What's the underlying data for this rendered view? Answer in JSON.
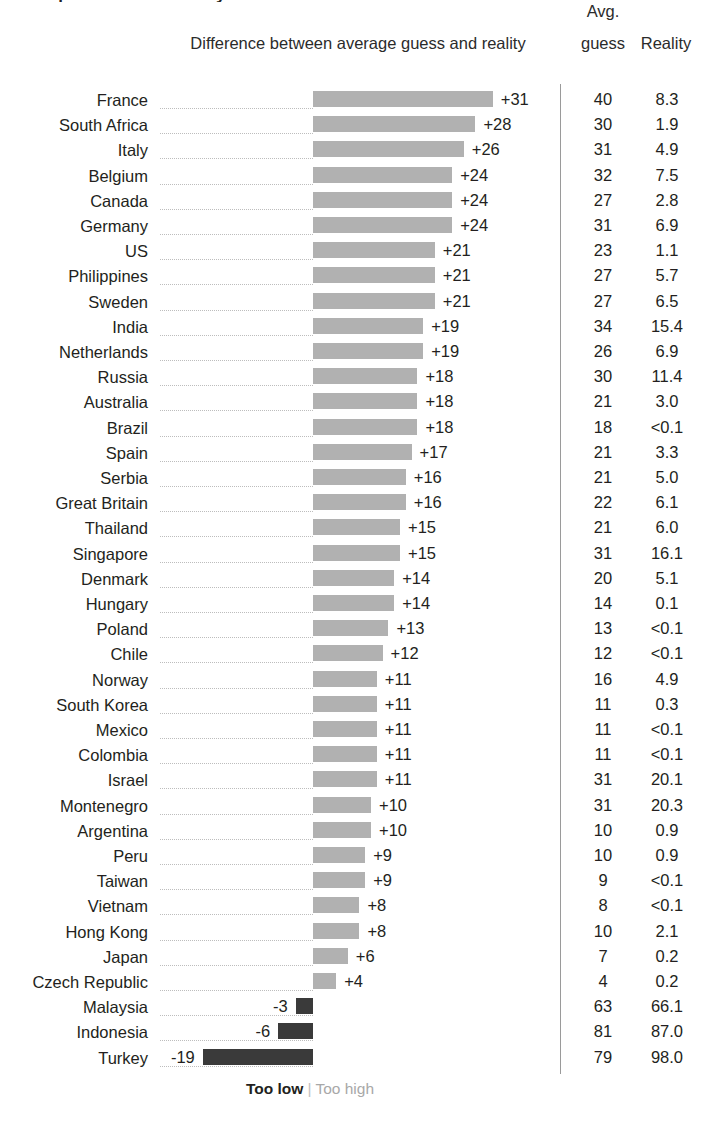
{
  "title_sliver": "Perceptions are not reality",
  "headers": {
    "difference": "Difference between average guess and reality",
    "avg_line1": "Avg.",
    "avg_line2": "guess",
    "reality": "Reality"
  },
  "legend": {
    "too_low": "Too low",
    "separator": "|",
    "too_high": "Too high"
  },
  "chart_data": {
    "type": "bar",
    "title": "Perceptions are not reality",
    "xlabel": "Difference between average guess and reality",
    "ylabel": "",
    "orientation": "horizontal",
    "baseline": 0,
    "grid": false,
    "legend_position": "bottom",
    "legend": [
      {
        "label": "Too low",
        "color": "#3a3a3a"
      },
      {
        "label": "Too high",
        "color": "#b1b1b1"
      }
    ],
    "columns": [
      "Country",
      "Difference",
      "Avg. guess",
      "Reality"
    ],
    "categories": [
      "France",
      "South Africa",
      "Italy",
      "Belgium",
      "Canada",
      "Germany",
      "US",
      "Philippines",
      "Sweden",
      "India",
      "Netherlands",
      "Russia",
      "Australia",
      "Brazil",
      "Spain",
      "Serbia",
      "Great Britain",
      "Thailand",
      "Singapore",
      "Denmark",
      "Hungary",
      "Poland",
      "Chile",
      "Norway",
      "South Korea",
      "Mexico",
      "Colombia",
      "Israel",
      "Montenegro",
      "Argentina",
      "Peru",
      "Taiwan",
      "Vietnam",
      "Hong Kong",
      "Japan",
      "Czech Republic",
      "Malaysia",
      "Indonesia",
      "Turkey"
    ],
    "values": [
      31,
      28,
      26,
      24,
      24,
      24,
      21,
      21,
      21,
      19,
      19,
      18,
      18,
      18,
      17,
      16,
      16,
      15,
      15,
      14,
      14,
      13,
      12,
      11,
      11,
      11,
      11,
      11,
      10,
      10,
      9,
      9,
      8,
      8,
      6,
      4,
      -3,
      -6,
      -19
    ],
    "rows": [
      {
        "country": "France",
        "difference": 31,
        "difference_label": "+31",
        "avg_guess": "40",
        "reality": "8.3"
      },
      {
        "country": "South Africa",
        "difference": 28,
        "difference_label": "+28",
        "avg_guess": "30",
        "reality": "1.9"
      },
      {
        "country": "Italy",
        "difference": 26,
        "difference_label": "+26",
        "avg_guess": "31",
        "reality": "4.9"
      },
      {
        "country": "Belgium",
        "difference": 24,
        "difference_label": "+24",
        "avg_guess": "32",
        "reality": "7.5"
      },
      {
        "country": "Canada",
        "difference": 24,
        "difference_label": "+24",
        "avg_guess": "27",
        "reality": "2.8"
      },
      {
        "country": "Germany",
        "difference": 24,
        "difference_label": "+24",
        "avg_guess": "31",
        "reality": "6.9"
      },
      {
        "country": "US",
        "difference": 21,
        "difference_label": "+21",
        "avg_guess": "23",
        "reality": "1.1"
      },
      {
        "country": "Philippines",
        "difference": 21,
        "difference_label": "+21",
        "avg_guess": "27",
        "reality": "5.7"
      },
      {
        "country": "Sweden",
        "difference": 21,
        "difference_label": "+21",
        "avg_guess": "27",
        "reality": "6.5"
      },
      {
        "country": "India",
        "difference": 19,
        "difference_label": "+19",
        "avg_guess": "34",
        "reality": "15.4"
      },
      {
        "country": "Netherlands",
        "difference": 19,
        "difference_label": "+19",
        "avg_guess": "26",
        "reality": "6.9"
      },
      {
        "country": "Russia",
        "difference": 18,
        "difference_label": "+18",
        "avg_guess": "30",
        "reality": "11.4"
      },
      {
        "country": "Australia",
        "difference": 18,
        "difference_label": "+18",
        "avg_guess": "21",
        "reality": "3.0"
      },
      {
        "country": "Brazil",
        "difference": 18,
        "difference_label": "+18",
        "avg_guess": "18",
        "reality": "<0.1"
      },
      {
        "country": "Spain",
        "difference": 17,
        "difference_label": "+17",
        "avg_guess": "21",
        "reality": "3.3"
      },
      {
        "country": "Serbia",
        "difference": 16,
        "difference_label": "+16",
        "avg_guess": "21",
        "reality": "5.0"
      },
      {
        "country": "Great Britain",
        "difference": 16,
        "difference_label": "+16",
        "avg_guess": "22",
        "reality": "6.1"
      },
      {
        "country": "Thailand",
        "difference": 15,
        "difference_label": "+15",
        "avg_guess": "21",
        "reality": "6.0"
      },
      {
        "country": "Singapore",
        "difference": 15,
        "difference_label": "+15",
        "avg_guess": "31",
        "reality": "16.1"
      },
      {
        "country": "Denmark",
        "difference": 14,
        "difference_label": "+14",
        "avg_guess": "20",
        "reality": "5.1"
      },
      {
        "country": "Hungary",
        "difference": 14,
        "difference_label": "+14",
        "avg_guess": "14",
        "reality": "0.1"
      },
      {
        "country": "Poland",
        "difference": 13,
        "difference_label": "+13",
        "avg_guess": "13",
        "reality": "<0.1"
      },
      {
        "country": "Chile",
        "difference": 12,
        "difference_label": "+12",
        "avg_guess": "12",
        "reality": "<0.1"
      },
      {
        "country": "Norway",
        "difference": 11,
        "difference_label": "+11",
        "avg_guess": "16",
        "reality": "4.9"
      },
      {
        "country": "South Korea",
        "difference": 11,
        "difference_label": "+11",
        "avg_guess": "11",
        "reality": "0.3"
      },
      {
        "country": "Mexico",
        "difference": 11,
        "difference_label": "+11",
        "avg_guess": "11",
        "reality": "<0.1"
      },
      {
        "country": "Colombia",
        "difference": 11,
        "difference_label": "+11",
        "avg_guess": "11",
        "reality": "<0.1"
      },
      {
        "country": "Israel",
        "difference": 11,
        "difference_label": "+11",
        "avg_guess": "31",
        "reality": "20.1"
      },
      {
        "country": "Montenegro",
        "difference": 10,
        "difference_label": "+10",
        "avg_guess": "31",
        "reality": "20.3"
      },
      {
        "country": "Argentina",
        "difference": 10,
        "difference_label": "+10",
        "avg_guess": "10",
        "reality": "0.9"
      },
      {
        "country": "Peru",
        "difference": 9,
        "difference_label": "+9",
        "avg_guess": "10",
        "reality": "0.9"
      },
      {
        "country": "Taiwan",
        "difference": 9,
        "difference_label": "+9",
        "avg_guess": "9",
        "reality": "<0.1"
      },
      {
        "country": "Vietnam",
        "difference": 8,
        "difference_label": "+8",
        "avg_guess": "8",
        "reality": "<0.1"
      },
      {
        "country": "Hong Kong",
        "difference": 8,
        "difference_label": "+8",
        "avg_guess": "10",
        "reality": "2.1"
      },
      {
        "country": "Japan",
        "difference": 6,
        "difference_label": "+6",
        "avg_guess": "7",
        "reality": "0.2"
      },
      {
        "country": "Czech Republic",
        "difference": 4,
        "difference_label": "+4",
        "avg_guess": "4",
        "reality": "0.2"
      },
      {
        "country": "Malaysia",
        "difference": -3,
        "difference_label": "-3",
        "avg_guess": "63",
        "reality": "66.1"
      },
      {
        "country": "Indonesia",
        "difference": -6,
        "difference_label": "-6",
        "avg_guess": "81",
        "reality": "87.0"
      },
      {
        "country": "Turkey",
        "difference": -19,
        "difference_label": "-19",
        "avg_guess": "79",
        "reality": "98.0"
      }
    ]
  },
  "colors": {
    "bar_positive": "#b1b1b1",
    "bar_negative": "#3a3a3a",
    "text": "#231f20",
    "muted": "#a8a8a8",
    "divider": "#9a9a9a",
    "leader": "#bdbdbd"
  }
}
